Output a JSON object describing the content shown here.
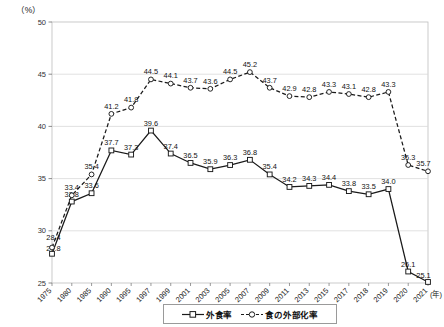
{
  "chart_data": {
    "type": "line",
    "title": "",
    "unit_label": "（%）",
    "xlabel": "(年)",
    "ylabel": "",
    "ylim": [
      25,
      50
    ],
    "yticks": [
      25,
      30,
      35,
      40,
      45,
      50
    ],
    "grid": true,
    "legend_position": "bottom",
    "categories": [
      "1975",
      "1980",
      "1985",
      "1990",
      "1995",
      "1997",
      "1999",
      "2001",
      "2003",
      "2005",
      "2007",
      "2009",
      "2011",
      "2013",
      "2015",
      "2017",
      "2018",
      "2019",
      "2020",
      "2021"
    ],
    "series": [
      {
        "name": "外食率",
        "marker": "square",
        "line_style": "solid",
        "color": "#1a1a1a",
        "values": [
          27.8,
          32.8,
          33.6,
          37.7,
          37.3,
          39.6,
          37.4,
          36.5,
          35.9,
          36.3,
          36.8,
          35.4,
          34.2,
          34.3,
          34.4,
          33.8,
          33.5,
          34.0,
          26.1,
          25.1
        ]
      },
      {
        "name": "食の外部化率",
        "marker": "circle",
        "line_style": "dashed",
        "color": "#1a1a1a",
        "values": [
          28.4,
          33.4,
          35.4,
          41.2,
          41.8,
          44.5,
          44.1,
          43.7,
          43.6,
          44.5,
          45.2,
          43.7,
          42.9,
          42.8,
          43.3,
          43.1,
          42.8,
          43.3,
          36.3,
          35.7
        ]
      }
    ],
    "data_labels": {
      "外食率": [
        "27.8",
        "32.8",
        "33.6",
        "37.7",
        "37.3",
        "39.6",
        "37.4",
        "36.5",
        "35.9",
        "36.3",
        "36.8",
        "35.4",
        "34.2",
        "34.3",
        "34.4",
        "33.8",
        "33.5",
        "34.0",
        "26.1",
        "25.1"
      ],
      "食の外部化率": [
        "28.4",
        "33.4",
        "35.4",
        "41.2",
        "41.8",
        "44.5",
        "44.1",
        "43.7",
        "43.6",
        "44.5",
        "45.2",
        "43.7",
        "42.9",
        "42.8",
        "43.3",
        "43.1",
        "42.8",
        "43.3",
        "36.3",
        "35.7"
      ]
    }
  },
  "legend": {
    "items": [
      {
        "label": "外食率"
      },
      {
        "label": "食の外部化率"
      }
    ]
  }
}
